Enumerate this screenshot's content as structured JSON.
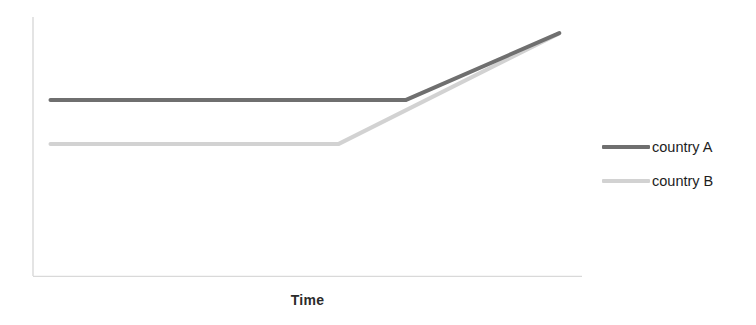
{
  "chart_data": {
    "type": "line",
    "title": "",
    "subtitle": "",
    "xlabel": "Time",
    "ylabel": "",
    "grid": false,
    "legend_position": "right",
    "xlim": [
      0,
      100
    ],
    "ylim": [
      0,
      100
    ],
    "axis_color": "#d9d9d9",
    "axis_ticks": false,
    "x_tick_labels": [],
    "y_tick_labels": [],
    "annotations": [],
    "series": [
      {
        "name": "country A",
        "color": "#6f6f6f",
        "width": 4,
        "x": [
          1.6,
          68.7,
          97.6
        ],
        "y": [
          68.0,
          68.0,
          93.8
        ]
      },
      {
        "name": "country B",
        "color": "#d2d2d2",
        "width": 4,
        "x": [
          1.6,
          56.0,
          97.3
        ],
        "y": [
          51.0,
          51.0,
          93.4
        ]
      }
    ]
  },
  "axis": {
    "x_label": "Time"
  },
  "legend": {
    "items": [
      {
        "label": "country A",
        "swatch_color": "#6f6f6f",
        "swatch_name": "legend-swatch-country-a"
      },
      {
        "label": "country B",
        "swatch_color": "#d2d2d2",
        "swatch_name": "legend-swatch-country-b"
      }
    ]
  }
}
